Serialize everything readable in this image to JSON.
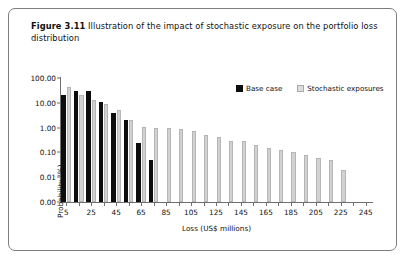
{
  "caption": {
    "label": "Figure 3.11",
    "text": "Illustration of the impact of stochastic exposure on the portfolio loss distribution"
  },
  "legend": {
    "items": [
      {
        "name": "Base case",
        "color": "#0d0d0d"
      },
      {
        "name": "Stochastic exposures",
        "color": "#dcdcdc"
      }
    ]
  },
  "chart_data": {
    "type": "bar",
    "title": "Illustration of the impact of stochastic exposure on the portfolio loss distribution",
    "xlabel": "Loss (US$ millions)",
    "ylabel": "Probability (%)",
    "yscale": "log",
    "ytick_labels": [
      "100.00",
      "10.00",
      "1.00",
      "0.10",
      "0.01",
      "0.00"
    ],
    "ytick_values": [
      100.0,
      10.0,
      1.0,
      0.1,
      0.01,
      0.001
    ],
    "ylim": [
      0.001,
      100.0
    ],
    "xlim": [
      0,
      250
    ],
    "xtick_labels": [
      "5",
      "25",
      "45",
      "65",
      "85",
      "105",
      "125",
      "145",
      "165",
      "185",
      "205",
      "225",
      "245"
    ],
    "xtick_values": [
      5,
      25,
      45,
      65,
      85,
      105,
      125,
      145,
      165,
      185,
      205,
      225,
      245
    ],
    "xminor_step": 10,
    "grid": false,
    "legend_position": "top-right",
    "categories": [
      5,
      15,
      25,
      35,
      45,
      55,
      65,
      75,
      85,
      95,
      105,
      115,
      125,
      135,
      145,
      155,
      165,
      175,
      185,
      195,
      205,
      215,
      225,
      235,
      245
    ],
    "series": [
      {
        "name": "Base case",
        "color": "#0d0d0d",
        "values": [
          20.0,
          30.0,
          30.0,
          11.0,
          4.0,
          2.0,
          0.25,
          0.05,
          null,
          null,
          null,
          null,
          null,
          null,
          null,
          null,
          null,
          null,
          null,
          null,
          null,
          null,
          null,
          null,
          null
        ]
      },
      {
        "name": "Stochastic exposures",
        "color": "#dcdcdc",
        "values": [
          45.0,
          20.0,
          13.0,
          9.0,
          5.0,
          2.0,
          1.1,
          1.0,
          1.0,
          0.9,
          0.7,
          0.5,
          0.42,
          0.3,
          0.28,
          0.2,
          0.15,
          0.12,
          0.1,
          0.08,
          0.06,
          0.05,
          0.02,
          null,
          null
        ]
      }
    ]
  }
}
